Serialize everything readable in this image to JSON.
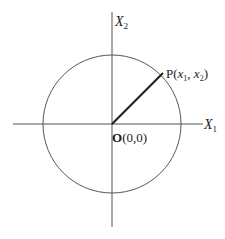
{
  "diagram": {
    "title": "",
    "axes": {
      "x": {
        "label_main": "X",
        "label_sub": "1"
      },
      "y": {
        "label_main": "X",
        "label_sub": "2"
      }
    },
    "origin": {
      "label_bold": "O",
      "label_rest": "(0,0)"
    },
    "point": {
      "name": "P",
      "open": "(",
      "x_var": "x",
      "x_sub": "1",
      "sep": ", ",
      "y_var": "x",
      "y_sub": "2",
      "close": ")"
    },
    "shapes": {
      "circle": {
        "center": [
          112,
          124
        ],
        "radius": 69
      },
      "radius_segment": {
        "from": [
          112,
          124
        ],
        "to": [
          163,
          73
        ]
      }
    },
    "colors": {
      "line": "#444444",
      "text": "#222222",
      "background": "#ffffff"
    }
  }
}
